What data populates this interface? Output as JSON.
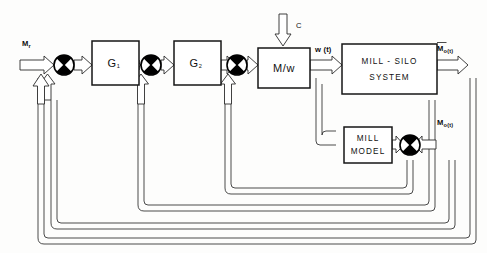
{
  "diagram": {
    "background_color": "#fdfdfc",
    "line_color": "#2b2b2b",
    "box_stroke_color": "#161616",
    "blocks": [
      {
        "id": "g1",
        "label": "G",
        "sub": "1",
        "x": 92,
        "y": 41,
        "w": 47,
        "h": 44
      },
      {
        "id": "g2",
        "label": "G",
        "sub": "2",
        "x": 174,
        "y": 41,
        "w": 47,
        "h": 44
      },
      {
        "id": "mw",
        "label": "M/w",
        "x": 258,
        "y": 48,
        "w": 52,
        "h": 40
      },
      {
        "id": "mill_silo",
        "line1": "MILL - SILO",
        "line2": "SYSTEM",
        "x": 342,
        "y": 44,
        "w": 95,
        "h": 50
      },
      {
        "id": "mill_model",
        "line1": "MILL",
        "line2": "MODEL",
        "x": 344,
        "y": 127,
        "w": 48,
        "h": 36
      }
    ],
    "summers": [
      {
        "id": "sum1",
        "cx": 64,
        "cy": 65
      },
      {
        "id": "sum2",
        "cx": 151,
        "cy": 65
      },
      {
        "id": "sum3",
        "cx": 237,
        "cy": 65
      },
      {
        "id": "sum4",
        "cx": 410,
        "cy": 145
      }
    ],
    "labels": {
      "input_mr": "M",
      "input_mr_sub": "r",
      "disturbance_c": "C",
      "signal_w": "w (t)",
      "output_mo_bar": "M",
      "output_mo_bar_sub": "o(t)",
      "output_mo": "M",
      "output_mo_sub": "o(t)"
    }
  }
}
